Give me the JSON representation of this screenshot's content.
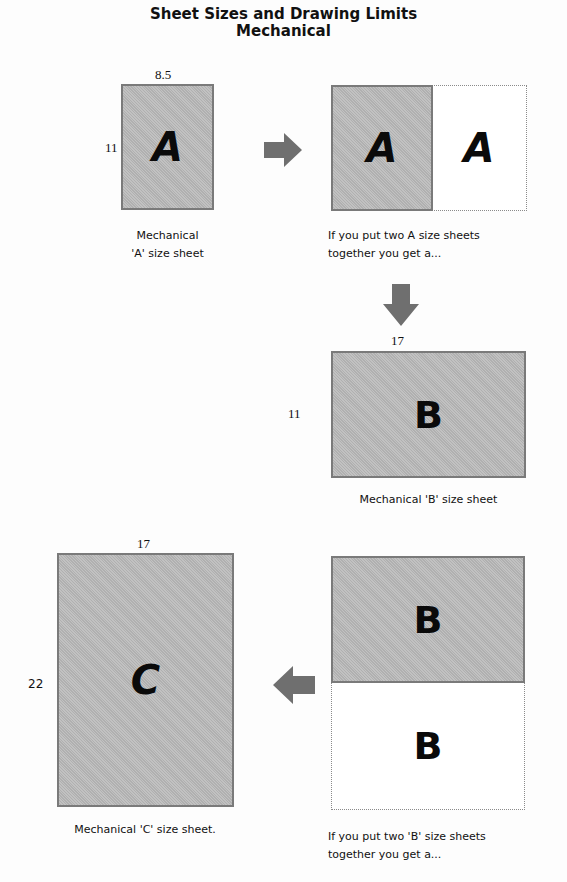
{
  "title": {
    "line1": "Sheet Sizes and Drawing Limits",
    "line2": "Mechanical"
  },
  "colors": {
    "sheet_fill": "#b9b9b9",
    "sheet_border": "#7a7a7a",
    "arrow": "#6f6f6f",
    "letter": "#0a0a0a"
  },
  "sheet_a": {
    "letter": "A",
    "width_label": "8.5",
    "height_label": "11",
    "caption_line1": "Mechanical",
    "caption_line2": "'A' size sheet"
  },
  "combine_a": {
    "letters": [
      "A",
      "A"
    ],
    "caption_line1": "If you put two A size sheets",
    "caption_line2": "together you get a..."
  },
  "sheet_b": {
    "letter": "B",
    "width_label": "17",
    "height_label": "11",
    "caption": "Mechanical 'B' size sheet"
  },
  "combine_b": {
    "letters": [
      "B",
      "B"
    ],
    "caption_line1": "If you put two 'B' size sheets",
    "caption_line2": "together you get a..."
  },
  "sheet_c": {
    "letter": "C",
    "width_label": "17",
    "height_label": "22",
    "caption": "Mechanical 'C' size sheet."
  },
  "arrows": {
    "a_to_combined": "arrow-right",
    "combined_to_b": "arrow-down",
    "combined_b_to_c": "arrow-left"
  }
}
